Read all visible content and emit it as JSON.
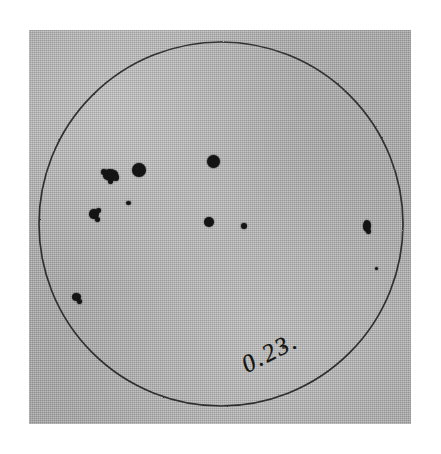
{
  "image": {
    "kind": "scanned-photograph",
    "subject": "hand-drawn solar disk sunspot record",
    "width_px": 441,
    "height_px": 454,
    "page_background_color": "#ffffff",
    "paper_color": "#a9a9a9",
    "ink_color": "#141414"
  },
  "paper": {
    "label": "photographed paper sheet",
    "left_px": 29,
    "top_px": 30,
    "width_px": 382,
    "height_px": 394
  },
  "solar_disk": {
    "label": "solar disk outline",
    "center_x_px": 221,
    "center_y_px": 224,
    "radius_px": 182,
    "outline_color": "#2b2b2b",
    "outline_width_px": 1.6,
    "fill": "none"
  },
  "annotation": {
    "text": "0.23.",
    "label": "handwritten date or time annotation",
    "rotation_deg": -27,
    "left_px": 243,
    "top_px": 352
  },
  "sunspots": [
    {
      "id": "spot-1",
      "label": "lobed spot group west-northwest",
      "cx": 110,
      "cy": 175,
      "w": 15,
      "h": 12,
      "shape": "lobed"
    },
    {
      "id": "spot-2",
      "label": "large round spot",
      "cx": 139,
      "cy": 170,
      "w": 14,
      "h": 14,
      "shape": "round"
    },
    {
      "id": "spot-3",
      "label": "large round spot upper centre",
      "cx": 213,
      "cy": 161,
      "w": 13,
      "h": 13,
      "shape": "round"
    },
    {
      "id": "spot-4",
      "label": "tiny spot below group",
      "cx": 128,
      "cy": 203,
      "w": 5,
      "h": 4,
      "shape": "round"
    },
    {
      "id": "spot-5",
      "label": "irregular spot west",
      "cx": 94,
      "cy": 214,
      "w": 10,
      "h": 10,
      "shape": "blobby"
    },
    {
      "id": "spot-6",
      "label": "round spot centre",
      "cx": 209,
      "cy": 222,
      "w": 10,
      "h": 10,
      "shape": "round"
    },
    {
      "id": "spot-7",
      "label": "small spot centre east",
      "cx": 244,
      "cy": 226,
      "w": 6,
      "h": 6,
      "shape": "round"
    },
    {
      "id": "spot-8",
      "label": "elongated spot near east limb",
      "cx": 367,
      "cy": 226,
      "w": 8,
      "h": 12,
      "shape": "blobby"
    },
    {
      "id": "spot-9",
      "label": "small spot southwest",
      "cx": 76,
      "cy": 297,
      "w": 9,
      "h": 8,
      "shape": "blobby"
    },
    {
      "id": "spot-10",
      "label": "faint fleck east",
      "cx": 376,
      "cy": 268,
      "w": 3,
      "h": 3,
      "shape": "round"
    }
  ],
  "sunspot_count": 10,
  "chart_data": {
    "type": "scatter",
    "title": "0.23.",
    "xlabel": "",
    "ylabel": "",
    "disk_center": [
      221,
      224
    ],
    "disk_radius": 182,
    "xlim": [
      39,
      403
    ],
    "ylim": [
      42,
      406
    ],
    "grid": false,
    "legend": false,
    "points": [
      {
        "x": 110,
        "y": 175,
        "size": 15
      },
      {
        "x": 139,
        "y": 170,
        "size": 14
      },
      {
        "x": 213,
        "y": 161,
        "size": 13
      },
      {
        "x": 128,
        "y": 203,
        "size": 5
      },
      {
        "x": 94,
        "y": 214,
        "size": 10
      },
      {
        "x": 209,
        "y": 222,
        "size": 10
      },
      {
        "x": 244,
        "y": 226,
        "size": 6
      },
      {
        "x": 367,
        "y": 226,
        "size": 12
      },
      {
        "x": 76,
        "y": 297,
        "size": 9
      },
      {
        "x": 376,
        "y": 268,
        "size": 3
      }
    ],
    "annotations": [
      {
        "text": "0.23.",
        "x": 243,
        "y": 352,
        "rotation": -27
      }
    ]
  }
}
